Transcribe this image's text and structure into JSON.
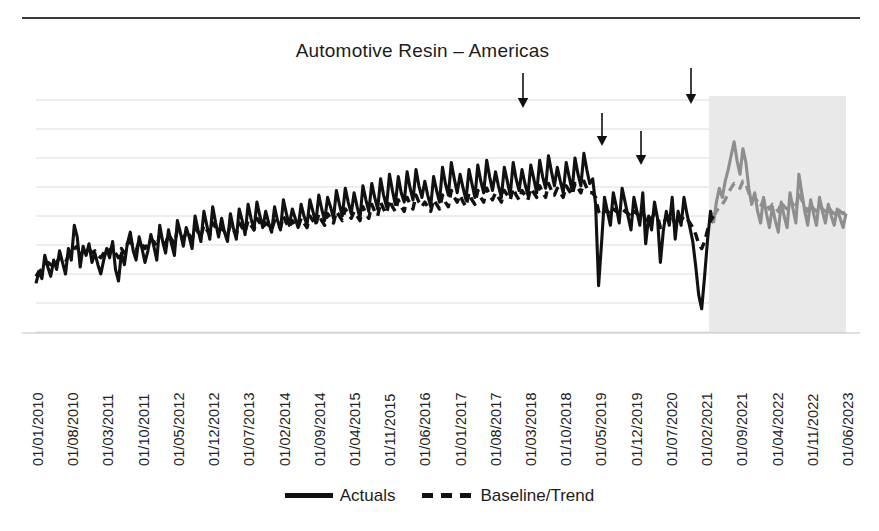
{
  "chart_data": {
    "type": "line",
    "title": "Automotive Resin – Americas",
    "xlabel": "",
    "ylabel": "",
    "grid": true,
    "grid_axis": "y",
    "legend_position": "bottom-center",
    "x_tick_rotation": 90,
    "xlim_labels": [
      "01/01/2010",
      "01/06/2023"
    ],
    "ylim": [
      0,
      100
    ],
    "y_tick_labels": [],
    "tick_labels": [
      "01/01/2010",
      "01/08/2010",
      "01/03/2011",
      "01/10/2011",
      "01/05/2012",
      "01/12/2012",
      "01/07/2013",
      "01/02/2014",
      "01/09/2014",
      "01/04/2015",
      "01/11/2015",
      "01/06/2016",
      "01/01/2017",
      "01/08/2017",
      "01/03/2018",
      "01/10/2018",
      "01/05/2019",
      "01/12/2019",
      "01/07/2020",
      "01/02/2021",
      "01/09/2021",
      "01/04/2022",
      "01/11/2022",
      "01/06/2023"
    ],
    "legend": [
      {
        "name": "Actuals",
        "style": "solid",
        "color": "#111111"
      },
      {
        "name": "Baseline/Trend",
        "style": "dashed",
        "color": "#111111"
      }
    ],
    "forecast_region": {
      "label": "forecast",
      "start_tick": "01/02/2021",
      "end_tick": "01/06/2023",
      "shade_color": "#e9e9e9",
      "line_color": "#8e8e8e"
    },
    "annotations": [
      {
        "type": "arrow",
        "direction": "down",
        "near_tick": "01/03/2018"
      },
      {
        "type": "arrow",
        "direction": "down",
        "near_tick": "01/05/2019"
      },
      {
        "type": "arrow",
        "direction": "down",
        "near_tick": "01/12/2019"
      },
      {
        "type": "arrow",
        "direction": "down",
        "near_tick": "01/02/2021"
      }
    ],
    "series": [
      {
        "name": "Actuals",
        "color": "#111111",
        "style": "solid",
        "values": [
          21,
          26,
          23,
          33,
          28,
          24,
          31,
          27,
          35,
          30,
          25,
          36,
          31,
          46,
          41,
          28,
          37,
          33,
          38,
          30,
          34,
          29,
          25,
          31,
          36,
          32,
          39,
          27,
          22,
          34,
          29,
          38,
          43,
          35,
          31,
          41,
          36,
          30,
          35,
          42,
          37,
          31,
          46,
          39,
          34,
          44,
          38,
          33,
          48,
          43,
          37,
          45,
          41,
          36,
          50,
          44,
          39,
          52,
          46,
          40,
          54,
          47,
          41,
          49,
          43,
          39,
          51,
          45,
          40,
          53,
          48,
          42,
          55,
          49,
          44,
          56,
          50,
          45,
          52,
          47,
          43,
          54,
          48,
          44,
          57,
          51,
          46,
          53,
          49,
          45,
          55,
          50,
          46,
          57,
          52,
          47,
          59,
          53,
          48,
          58,
          54,
          49,
          61,
          55,
          50,
          62,
          56,
          51,
          60,
          54,
          49,
          63,
          57,
          52,
          64,
          58,
          53,
          66,
          59,
          54,
          68,
          61,
          55,
          67,
          60,
          56,
          69,
          62,
          57,
          70,
          63,
          58,
          65,
          59,
          54,
          67,
          61,
          56,
          71,
          64,
          59,
          73,
          66,
          60,
          68,
          62,
          57,
          70,
          64,
          58,
          72,
          65,
          60,
          74,
          67,
          61,
          69,
          63,
          58,
          71,
          65,
          59,
          73,
          66,
          61,
          70,
          64,
          59,
          72,
          66,
          60,
          74,
          67,
          62,
          76,
          69,
          63,
          71,
          65,
          60,
          73,
          67,
          61,
          75,
          68,
          63,
          77,
          70,
          64,
          66,
          55,
          20,
          38,
          58,
          52,
          46,
          60,
          54,
          47,
          62,
          56,
          50,
          44,
          58,
          52,
          46,
          60,
          38,
          50,
          44,
          56,
          49,
          30,
          44,
          52,
          46,
          58,
          40,
          52,
          46,
          58,
          51,
          45,
          39,
          28,
          16,
          10,
          24,
          40,
          52,
          47,
          56,
          62,
          58,
          65,
          70,
          76,
          82,
          74,
          68,
          79,
          73,
          62,
          55,
          60,
          52,
          47,
          58,
          51,
          45,
          54,
          48,
          43,
          56,
          50,
          45,
          60,
          53,
          47,
          68,
          60,
          52,
          46,
          57,
          51,
          46,
          58,
          52,
          47,
          55,
          50,
          46,
          53,
          49,
          45,
          51
        ]
      },
      {
        "name": "Baseline/Trend",
        "color": "#111111",
        "style": "dashed",
        "values": [
          24,
          26,
          27,
          29,
          30,
          29,
          31,
          30,
          32,
          31,
          30,
          33,
          34,
          36,
          37,
          33,
          35,
          34,
          36,
          34,
          35,
          33,
          32,
          34,
          36,
          35,
          37,
          34,
          32,
          36,
          34,
          38,
          39,
          37,
          35,
          39,
          38,
          36,
          38,
          40,
          39,
          37,
          42,
          40,
          38,
          42,
          40,
          38,
          44,
          42,
          40,
          43,
          42,
          40,
          45,
          43,
          41,
          46,
          44,
          42,
          47,
          45,
          43,
          45,
          43,
          42,
          46,
          44,
          42,
          47,
          45,
          43,
          48,
          46,
          44,
          49,
          47,
          45,
          47,
          46,
          44,
          48,
          46,
          45,
          50,
          47,
          45,
          48,
          46,
          45,
          49,
          47,
          45,
          50,
          48,
          46,
          51,
          48,
          46,
          51,
          49,
          47,
          52,
          50,
          48,
          53,
          51,
          49,
          52,
          50,
          48,
          54,
          51,
          49,
          55,
          52,
          50,
          56,
          53,
          51,
          57,
          54,
          52,
          57,
          54,
          52,
          58,
          55,
          53,
          59,
          56,
          54,
          56,
          54,
          52,
          57,
          55,
          53,
          59,
          56,
          54,
          61,
          58,
          56,
          59,
          56,
          54,
          60,
          57,
          55,
          61,
          58,
          56,
          62,
          59,
          57,
          60,
          58,
          56,
          61,
          59,
          57,
          62,
          59,
          57,
          61,
          59,
          57,
          62,
          60,
          58,
          63,
          60,
          58,
          64,
          61,
          59,
          62,
          60,
          58,
          63,
          61,
          59,
          64,
          62,
          60,
          65,
          62,
          60,
          60,
          58,
          52,
          50,
          52,
          52,
          51,
          53,
          52,
          51,
          53,
          52,
          51,
          50,
          52,
          51,
          50,
          52,
          48,
          50,
          49,
          51,
          50,
          45,
          47,
          49,
          48,
          50,
          46,
          49,
          48,
          50,
          49,
          47,
          45,
          42,
          38,
          36,
          39,
          44,
          48,
          50,
          52,
          54,
          55,
          57,
          60,
          62,
          64,
          63,
          62,
          65,
          64,
          60,
          57,
          58,
          56,
          54,
          57,
          55,
          53,
          55,
          54,
          52,
          56,
          54,
          53,
          57,
          55,
          53,
          60,
          57,
          54,
          52,
          55,
          53,
          52,
          55,
          53,
          52,
          54,
          52,
          51,
          53,
          52,
          51,
          52
        ]
      }
    ]
  }
}
